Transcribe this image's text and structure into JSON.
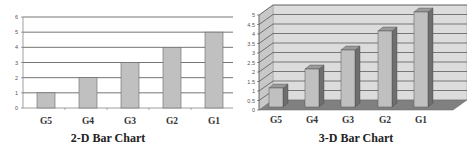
{
  "chart_data": [
    {
      "type": "bar",
      "title": "2-D Bar Chart",
      "categories": [
        "G5",
        "G4",
        "G3",
        "G2",
        "G1"
      ],
      "values": [
        1,
        2,
        3,
        4,
        5
      ],
      "xlabel": "",
      "ylabel": "",
      "ylim": [
        0,
        6
      ],
      "yticks": [
        "0",
        "1",
        "2",
        "3",
        "4",
        "5",
        "6"
      ],
      "grid": true,
      "legend": "none",
      "bar_color": "#c0c0c0"
    },
    {
      "type": "bar",
      "style": "3d",
      "title": "3-D Bar Chart",
      "categories": [
        "G5",
        "G4",
        "G3",
        "G2",
        "G1"
      ],
      "values": [
        1,
        2,
        3,
        4,
        5
      ],
      "xlabel": "",
      "ylabel": "",
      "ylim": [
        0,
        5
      ],
      "yticks": [
        "0",
        "0.5",
        "1",
        "1.5",
        "2",
        "2.5",
        "3",
        "3.5",
        "4",
        "4.5",
        "5"
      ],
      "grid": true,
      "legend": "none",
      "bar_color": "#c0c0c0",
      "wall_color": "#dcdcdc",
      "floor_color": "#808080"
    }
  ]
}
